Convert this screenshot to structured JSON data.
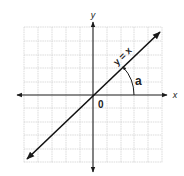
{
  "diagram": {
    "axes": {
      "x_label": "x",
      "y_label": "y",
      "origin_label": "0"
    },
    "line": {
      "equation_label": "y = x",
      "slope": 1
    },
    "angle": {
      "label": "a",
      "description": "angle between positive x-axis and line y = x"
    },
    "grid": {
      "shown": true,
      "cells_each_direction": 5
    },
    "colors": {
      "axis": "#1a1a1a",
      "line": "#111111",
      "grid": "#cfcfcf",
      "background": "#ffffff"
    }
  }
}
